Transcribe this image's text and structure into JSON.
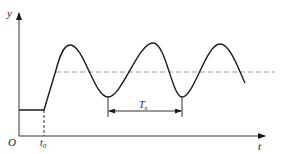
{
  "diagram": {
    "type": "damped-oscillation-response",
    "colors": {
      "curve": "#1a1a1a",
      "axis": "#333333",
      "dashed": "#9a9a9a",
      "background": "#ffffff"
    },
    "labels": {
      "y_axis": "y",
      "x_axis": "t",
      "origin": "O",
      "t0": "t",
      "t0_sub": "0",
      "period": "T",
      "period_sub": "s"
    },
    "axes": {
      "origin": [
        19,
        136
      ],
      "y_axis_top": [
        19,
        12
      ],
      "x_axis_right": [
        265,
        136
      ]
    },
    "baseline": {
      "y": 110,
      "x_start": 19,
      "x_end": 44
    },
    "t0_marker": {
      "x": 44,
      "y_top": 110,
      "y_bottom": 136
    },
    "steady_state_level": {
      "y": 72,
      "x_start": 56,
      "x_end": 275
    },
    "curve_points": [
      [
        44,
        110
      ],
      [
        56,
        70
      ],
      [
        70,
        45
      ],
      [
        108,
        97
      ],
      [
        153,
        43
      ],
      [
        182,
        97
      ],
      [
        220,
        44
      ],
      [
        245,
        83
      ]
    ],
    "period_marker": {
      "x_start": 108,
      "x_end": 182,
      "y": 111,
      "tick_top": 97,
      "tick_bottom": 117
    }
  }
}
